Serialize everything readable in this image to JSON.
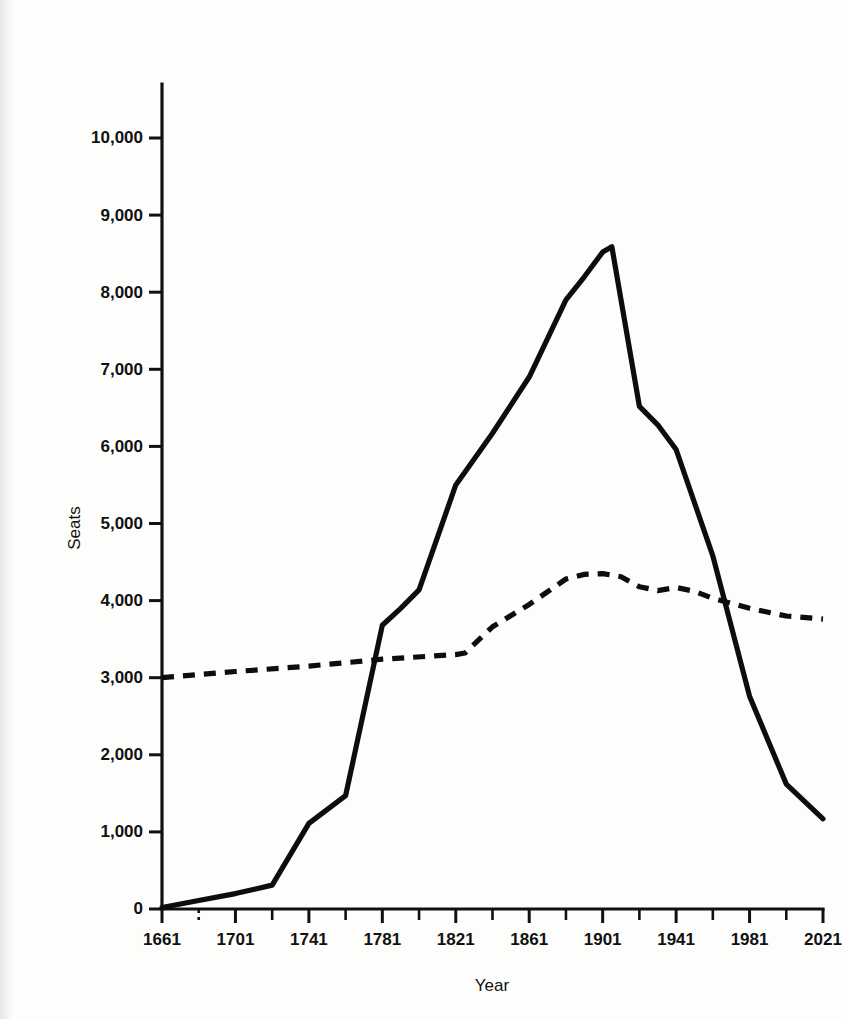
{
  "figure": {
    "background_color": "#fdfdfb",
    "ink_color": "#0d0d0d"
  },
  "axes": {
    "y_title": "Seats",
    "x_title": "Year",
    "y_tick_labels": [
      "0",
      "1,000",
      "2,000",
      "3,000",
      "4,000",
      "5,000",
      "6,000",
      "7,000",
      "8,000",
      "9,000",
      "10,000"
    ],
    "x_tick_labels": [
      "1661",
      "1701",
      "1741",
      "1781",
      "1821",
      "1861",
      "1901",
      "1941",
      "1981",
      "2021"
    ]
  },
  "chart_data": {
    "type": "line",
    "title": "",
    "xlabel": "Year",
    "ylabel": "Seats",
    "xlim": [
      1661,
      2021
    ],
    "ylim": [
      0,
      10500
    ],
    "y_ticks": [
      0,
      1000,
      2000,
      3000,
      4000,
      5000,
      6000,
      7000,
      8000,
      9000,
      10000
    ],
    "y_tick_labels": [
      "0",
      "1,000",
      "2,000",
      "3,000",
      "4,000",
      "5,000",
      "6,000",
      "7,000",
      "8,000",
      "9,000",
      "10,000"
    ],
    "x_ticks": [
      1661,
      1701,
      1741,
      1781,
      1821,
      1861,
      1901,
      1941,
      1981,
      2021
    ],
    "x_minor_ticks": [
      1681,
      1721,
      1761,
      1801,
      1841,
      1881,
      1921,
      1961,
      2001
    ],
    "grid": false,
    "legend": null,
    "legend_position": "none",
    "annotations": [
      {
        "text": "dashed minor tick at 1681 on the x-axis",
        "x": 1681,
        "y": 0
      }
    ],
    "series": [
      {
        "name": "Solid line",
        "style": "solid",
        "x": [
          1661,
          1681,
          1701,
          1721,
          1741,
          1761,
          1781,
          1791,
          1801,
          1821,
          1841,
          1861,
          1881,
          1891,
          1901,
          1906,
          1921,
          1931,
          1941,
          1961,
          1981,
          2001,
          2021
        ],
        "values": [
          20,
          110,
          200,
          310,
          1110,
          1470,
          3680,
          3900,
          4140,
          5500,
          6170,
          6900,
          7900,
          8200,
          8520,
          8590,
          6520,
          6280,
          5960,
          4580,
          2760,
          1620,
          1170
        ]
      },
      {
        "name": "Dashed line",
        "style": "dashed",
        "x": [
          1661,
          1701,
          1741,
          1781,
          1821,
          1826,
          1841,
          1861,
          1881,
          1891,
          1901,
          1911,
          1921,
          1931,
          1941,
          1951,
          1961,
          1981,
          2001,
          2021
        ],
        "values": [
          3000,
          3080,
          3150,
          3240,
          3300,
          3320,
          3660,
          3950,
          4280,
          4340,
          4350,
          4310,
          4180,
          4130,
          4170,
          4120,
          4030,
          3900,
          3800,
          3760
        ]
      }
    ]
  }
}
